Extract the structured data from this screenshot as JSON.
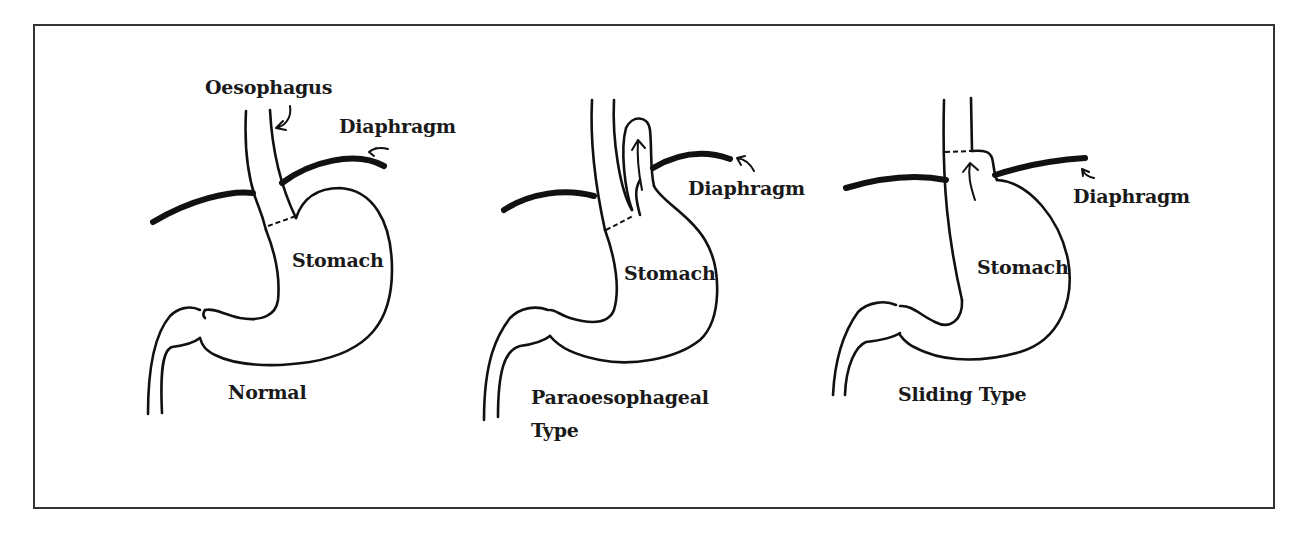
{
  "figure": {
    "title": "",
    "panels": [
      {
        "id": "normal",
        "caption": "Normal",
        "labels": {
          "oesophagus": "Oesophagus",
          "diaphragm": "Diaphragm",
          "stomach": "Stomach"
        }
      },
      {
        "id": "paraoesophageal",
        "caption_line1": "Paraoesophageal",
        "caption_line2": "Type",
        "labels": {
          "diaphragm": "Diaphragm",
          "stomach": "Stomach"
        }
      },
      {
        "id": "sliding",
        "caption": "Sliding Type",
        "labels": {
          "diaphragm": "Diaphragm",
          "stomach": "Stomach"
        }
      }
    ]
  },
  "colors": {
    "line": "#111111",
    "frame": "#333333",
    "background": "#ffffff"
  }
}
